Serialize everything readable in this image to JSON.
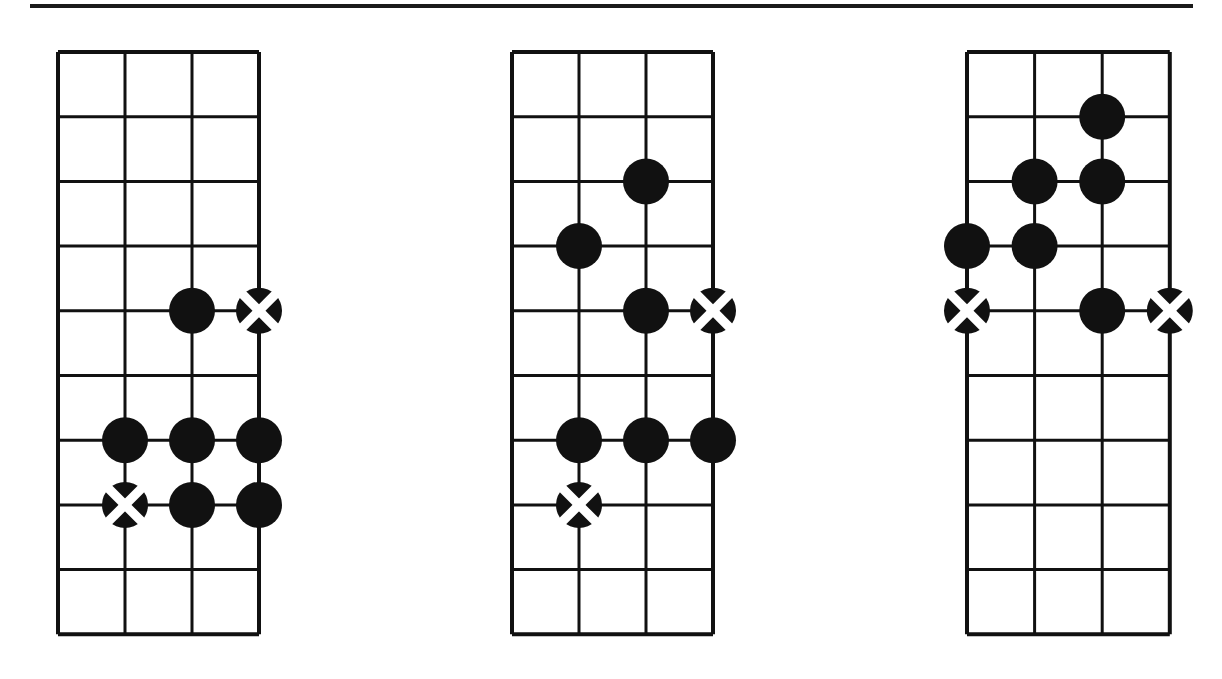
{
  "page": {
    "background_color": "#ffffff",
    "ink_color": "#111111",
    "width": 1222,
    "height": 679,
    "content_type": "fretboard-chord-diagrams",
    "diagram_count": 3
  },
  "rules": [
    {
      "name": "top-horizontal-rule",
      "x": 30,
      "y": 4,
      "width": 1163,
      "height": 4,
      "color": "#1a1a1a"
    }
  ],
  "marker_styles": {
    "filled": {
      "fill": "#111111",
      "label": "filled-dot"
    },
    "crossed": {
      "fill": "#111111",
      "cross": "#ffffff",
      "label": "crossed-dot"
    }
  },
  "grid_spec": {
    "strings": 4,
    "frets": 9,
    "string_spacing": 67.5,
    "fret_spacing": 64.7,
    "line_width_outer": 4,
    "line_width_inner": 3,
    "dot_radius": 23
  },
  "diagrams": [
    {
      "name": "fretboard-diagram-1",
      "index": 1,
      "origin_x": 58,
      "origin_y": 52,
      "string_spacing": 67,
      "fret_spacing": 64.7,
      "strings": 4,
      "frets": 9,
      "markers": [
        {
          "string": 3,
          "fret": 4,
          "type": "filled"
        },
        {
          "string": 4,
          "fret": 4,
          "type": "crossed"
        },
        {
          "string": 2,
          "fret": 6,
          "type": "filled"
        },
        {
          "string": 3,
          "fret": 6,
          "type": "filled"
        },
        {
          "string": 4,
          "fret": 6,
          "type": "filled"
        },
        {
          "string": 2,
          "fret": 7,
          "type": "crossed"
        },
        {
          "string": 3,
          "fret": 7,
          "type": "filled"
        },
        {
          "string": 4,
          "fret": 7,
          "type": "filled"
        }
      ]
    },
    {
      "name": "fretboard-diagram-2",
      "index": 2,
      "origin_x": 512,
      "origin_y": 52,
      "string_spacing": 67,
      "fret_spacing": 64.7,
      "strings": 4,
      "frets": 9,
      "markers": [
        {
          "string": 3,
          "fret": 2,
          "type": "filled"
        },
        {
          "string": 2,
          "fret": 3,
          "type": "filled"
        },
        {
          "string": 3,
          "fret": 4,
          "type": "filled"
        },
        {
          "string": 4,
          "fret": 4,
          "type": "crossed"
        },
        {
          "string": 2,
          "fret": 6,
          "type": "filled"
        },
        {
          "string": 3,
          "fret": 6,
          "type": "filled"
        },
        {
          "string": 4,
          "fret": 6,
          "type": "filled"
        },
        {
          "string": 2,
          "fret": 7,
          "type": "crossed"
        }
      ]
    },
    {
      "name": "fretboard-diagram-3",
      "index": 3,
      "origin_x": 967,
      "origin_y": 52,
      "string_spacing": 67.6,
      "fret_spacing": 64.7,
      "strings": 4,
      "frets": 9,
      "markers": [
        {
          "string": 3,
          "fret": 1,
          "type": "filled"
        },
        {
          "string": 2,
          "fret": 2,
          "type": "filled"
        },
        {
          "string": 3,
          "fret": 2,
          "type": "filled"
        },
        {
          "string": 1,
          "fret": 3,
          "type": "filled"
        },
        {
          "string": 2,
          "fret": 3,
          "type": "filled"
        },
        {
          "string": 1,
          "fret": 4,
          "type": "crossed"
        },
        {
          "string": 3,
          "fret": 4,
          "type": "filled"
        },
        {
          "string": 4,
          "fret": 4,
          "type": "crossed"
        }
      ]
    }
  ]
}
